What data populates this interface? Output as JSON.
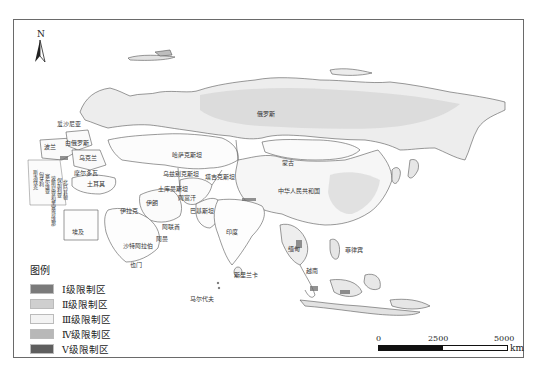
{
  "map": {
    "north_arrow_label": "N",
    "legend": {
      "title": "图例",
      "items": [
        {
          "label": "Ⅰ级限制区",
          "color": "#7a7a7a"
        },
        {
          "label": "Ⅱ级限制区",
          "color": "#cfcfcf"
        },
        {
          "label": "Ⅲ级限制区",
          "color": "#f3f3f3"
        },
        {
          "label": "Ⅳ级限制区",
          "color": "#b8b8b8"
        },
        {
          "label": "Ⅴ级限制区",
          "color": "#5e5e5e"
        }
      ]
    },
    "scale_bar": {
      "ticks": [
        "0",
        "2500",
        "5000"
      ],
      "unit": "km"
    },
    "country_labels": {
      "russia": "俄罗斯",
      "kazakhstan": "哈萨克斯坦",
      "mongolia": "蒙古",
      "china": "中华人民共和国",
      "iran": "伊朗",
      "afghanistan": "阿富汗",
      "pakistan": "巴基斯坦",
      "india": "印度",
      "turkmenistan": "土库曼斯坦",
      "uzbekistan": "乌兹别克斯坦",
      "tajikistan": "塔吉克斯坦",
      "turkey": "土耳其",
      "saudi_arabia": "沙特阿拉伯",
      "iraq": "伊拉克",
      "uae": "阿联酋",
      "oman": "阿曼",
      "yemen": "也门",
      "egypt": "埃及",
      "ukraine": "乌克兰",
      "belarus": "白俄罗斯",
      "poland": "波兰",
      "estonia": "爱沙尼亚",
      "moldova": "摩尔多瓦",
      "sri_lanka": "斯里兰卡",
      "maldives": "马尔代夫",
      "myanmar": "缅甸",
      "vietnam": "越南",
      "philippines": "菲律宾",
      "left_vertical_1": "斯洛伐克",
      "left_vertical_2": "匈牙利",
      "left_vertical_3": "塞尔维亚",
      "left_vertical_4": "波斯尼亚和黑塞哥维那",
      "left_vertical_5": "保加利亚",
      "left_vertical_6": "北马其顿"
    }
  }
}
